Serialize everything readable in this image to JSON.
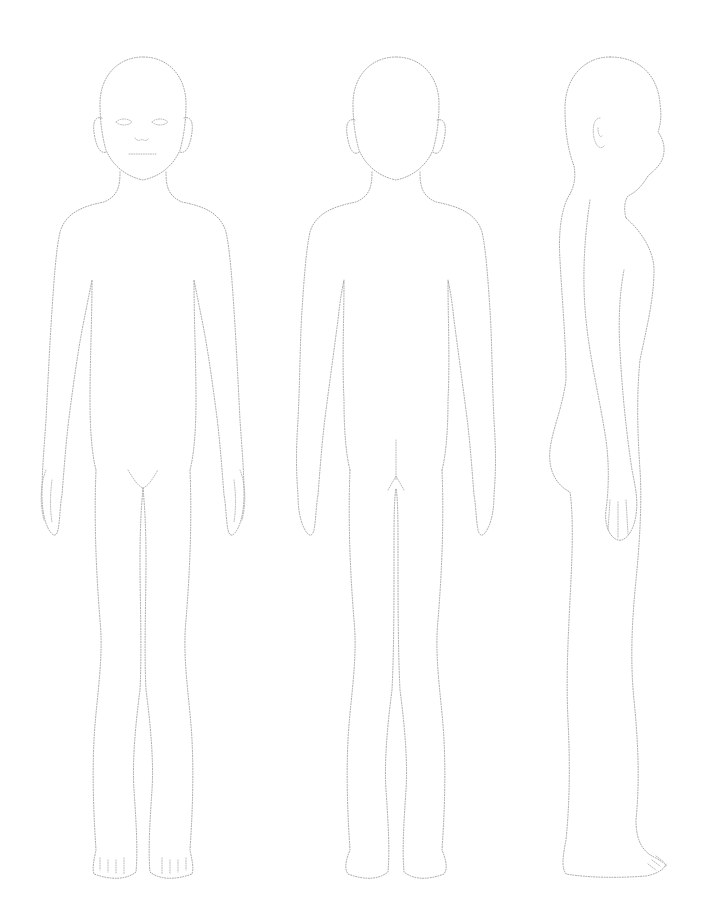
{
  "sheet": {
    "background": "#ffffff",
    "outline_color": "#9a9a9a",
    "outline_style": "dotted",
    "views": [
      {
        "id": "front",
        "label": ""
      },
      {
        "id": "back",
        "label": ""
      },
      {
        "id": "side",
        "label": ""
      }
    ]
  }
}
